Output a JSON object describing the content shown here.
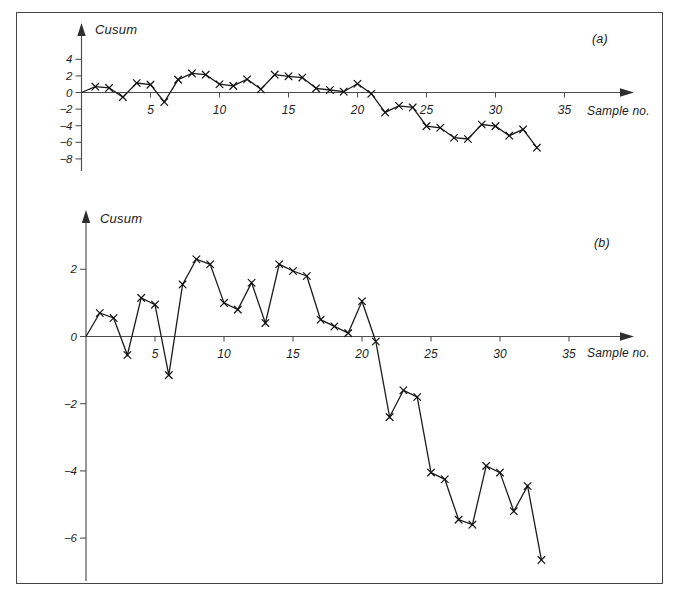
{
  "figure": {
    "background": "#ffffff",
    "frame_color": "#454545",
    "axis_color": "#4c4c4c",
    "ink_color": "#1b1b1b"
  },
  "chart_data": [
    {
      "id": "a",
      "type": "line",
      "panel_label": "(a)",
      "ylabel": "Cusum",
      "xlabel": "Sample no.",
      "marker": "x",
      "line_starts_at_origin": true,
      "grid": false,
      "legend": null,
      "x": [
        1,
        2,
        3,
        4,
        5,
        6,
        7,
        8,
        9,
        10,
        11,
        12,
        13,
        14,
        15,
        16,
        17,
        18,
        19,
        20,
        21,
        22,
        23,
        24,
        25,
        26,
        27,
        28,
        29,
        30,
        31,
        32,
        33
      ],
      "values": [
        0.7,
        0.55,
        -0.55,
        1.15,
        0.95,
        -1.15,
        1.55,
        2.3,
        2.15,
        1.0,
        0.8,
        1.6,
        0.4,
        2.15,
        1.95,
        1.8,
        0.5,
        0.3,
        0.1,
        1.05,
        -0.15,
        -2.4,
        -1.6,
        -1.8,
        -4.05,
        -4.25,
        -5.45,
        -5.6,
        -3.85,
        -4.05,
        -5.2,
        -4.45,
        -6.65
      ],
      "yticks": [
        4,
        2,
        0,
        -2,
        -4,
        -6,
        -8
      ],
      "xticks": [
        5,
        10,
        15,
        20,
        25,
        30,
        35
      ],
      "ylim": [
        -9.5,
        5.5
      ],
      "xlim": [
        0,
        39
      ]
    },
    {
      "id": "b",
      "type": "line",
      "panel_label": "(b)",
      "ylabel": "Cusum",
      "xlabel": "Sample no.",
      "marker": "x",
      "line_starts_at_origin": true,
      "grid": false,
      "legend": null,
      "x": [
        1,
        2,
        3,
        4,
        5,
        6,
        7,
        8,
        9,
        10,
        11,
        12,
        13,
        14,
        15,
        16,
        17,
        18,
        19,
        20,
        21,
        22,
        23,
        24,
        25,
        26,
        27,
        28,
        29,
        30,
        31,
        32,
        33
      ],
      "values": [
        0.7,
        0.55,
        -0.55,
        1.15,
        0.95,
        -1.15,
        1.55,
        2.3,
        2.15,
        1.0,
        0.8,
        1.6,
        0.4,
        2.15,
        1.95,
        1.8,
        0.5,
        0.3,
        0.1,
        1.05,
        -0.15,
        -2.4,
        -1.6,
        -1.8,
        -4.05,
        -4.25,
        -5.45,
        -5.6,
        -3.85,
        -4.05,
        -5.2,
        -4.45,
        -6.65
      ],
      "yticks": [
        2,
        0,
        -2,
        -4,
        -6
      ],
      "xticks": [
        5,
        10,
        15,
        20,
        25,
        30,
        35
      ],
      "ylim": [
        -7.3,
        3.7
      ],
      "xlim": [
        0,
        39
      ]
    }
  ]
}
